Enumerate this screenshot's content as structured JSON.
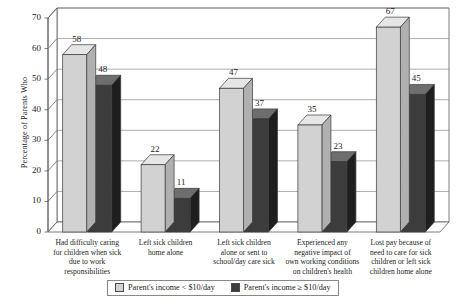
{
  "chart_data": {
    "type": "bar",
    "title": "",
    "xlabel": "",
    "ylabel": "Percentage of Parents Who",
    "ylim": [
      0,
      70
    ],
    "yticks": [
      0,
      10,
      20,
      30,
      40,
      50,
      60,
      70
    ],
    "grid": true,
    "legend_position": "bottom",
    "style": "3d-clustered-bar",
    "categories": [
      "Had difficulty caring for children when sick due to work responsibilities",
      "Left sick children home alone",
      "Left sick children alone or sent to school/day care sick",
      "Experienced any negative impact of own working conditions on children's health",
      "Lost pay because of need to care for sick children or left sick children home alone"
    ],
    "category_lines": [
      [
        "Had difficulty caring",
        "for children when sick",
        "due to work responsibilities"
      ],
      [
        "Left sick children",
        "home alone"
      ],
      [
        "Left sick children",
        "alone or sent to",
        "school/day care sick"
      ],
      [
        "Experienced any",
        "negative impact of",
        "own working conditions",
        "on children's health"
      ],
      [
        "Lost pay because of",
        "need to care for sick",
        "children or left sick",
        "children home alone"
      ]
    ],
    "series": [
      {
        "name": "Parent's income < $10/day",
        "color": "#d2d2d2",
        "values": [
          58,
          22,
          47,
          35,
          67
        ]
      },
      {
        "name": "Parent's income ≥ $10/day",
        "color": "#3c3c3c",
        "values": [
          48,
          11,
          37,
          23,
          45
        ]
      }
    ]
  },
  "axis": {
    "y_title": "Percentage of Parents Who",
    "y_ticks": [
      "70",
      "60",
      "50",
      "40",
      "30",
      "20",
      "10",
      "0"
    ]
  },
  "legend": {
    "entries": [
      {
        "label": "Parent's income < $10/day",
        "swatch": "light"
      },
      {
        "label": "Parent's income ≥ $10/day",
        "swatch": "dark"
      }
    ]
  },
  "colors": {
    "series_light_face": "#d2d2d2",
    "series_light_top": "#e6e6e6",
    "series_light_side": "#b0b0b0",
    "series_dark_face": "#3c3c3c",
    "series_dark_top": "#6e6e6e",
    "series_dark_side": "#1e1e1e",
    "grid": "#8a8a8a",
    "axis": "#5a5a5a",
    "text": "#1d1d1d",
    "background": "#ffffff"
  }
}
